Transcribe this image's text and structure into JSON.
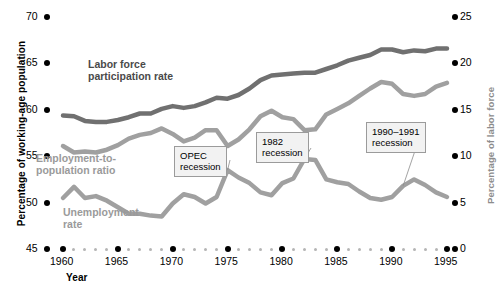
{
  "chart_data": {
    "type": "line",
    "title": "",
    "xlabel": "Year",
    "ylabel": "Percentage of working-age population",
    "ylabel_right": "Percentage of labor force",
    "x": [
      1960,
      1961,
      1962,
      1963,
      1964,
      1965,
      1966,
      1967,
      1968,
      1969,
      1970,
      1971,
      1972,
      1973,
      1974,
      1975,
      1976,
      1977,
      1978,
      1979,
      1980,
      1981,
      1982,
      1983,
      1984,
      1985,
      1986,
      1987,
      1988,
      1989,
      1990,
      1991,
      1992,
      1993,
      1994,
      1995
    ],
    "xlim": [
      1959,
      1995.5
    ],
    "xticks": [
      1960,
      1965,
      1970,
      1975,
      1980,
      1985,
      1990,
      1995
    ],
    "xticklabels": [
      "1960",
      "1965",
      "1970",
      "1975",
      "1980",
      "1985",
      "1990",
      "1995"
    ],
    "ylim": [
      45,
      70
    ],
    "yticks": [
      45,
      50,
      55,
      60,
      65,
      70
    ],
    "yticklabels": [
      "45",
      "50",
      "55",
      "60",
      "65",
      "70"
    ],
    "ylim_right": [
      0,
      25
    ],
    "yticks_right": [
      0,
      5,
      10,
      15,
      20,
      25
    ],
    "yticklabels_right": [
      "0",
      "5",
      "10",
      "15",
      "20",
      "25"
    ],
    "grid": false,
    "legend": "inline-labels",
    "series": [
      {
        "name": "Labor force participation rate",
        "axis": "left",
        "color": "#707070",
        "values": [
          59.4,
          59.3,
          58.8,
          58.7,
          58.7,
          58.9,
          59.2,
          59.6,
          59.6,
          60.1,
          60.4,
          60.2,
          60.4,
          60.8,
          61.3,
          61.2,
          61.6,
          62.3,
          63.2,
          63.7,
          63.8,
          63.9,
          64.0,
          64.0,
          64.4,
          64.8,
          65.3,
          65.6,
          65.9,
          66.5,
          66.5,
          66.2,
          66.4,
          66.3,
          66.6,
          66.6
        ]
      },
      {
        "name": "Employment-to-population ratio",
        "axis": "left",
        "color": "#a0a0a0",
        "values": [
          56.1,
          55.4,
          55.5,
          55.4,
          55.7,
          56.2,
          56.9,
          57.3,
          57.5,
          58.0,
          57.4,
          56.6,
          57.0,
          57.8,
          57.8,
          56.1,
          56.8,
          57.9,
          59.3,
          59.9,
          59.2,
          59.0,
          57.8,
          57.9,
          59.5,
          60.1,
          60.7,
          61.5,
          62.3,
          63.0,
          62.8,
          61.7,
          61.5,
          61.7,
          62.5,
          62.9
        ]
      },
      {
        "name": "Unemployment rate",
        "axis": "right",
        "color": "#a0a0a0",
        "values": [
          5.5,
          6.7,
          5.5,
          5.7,
          5.2,
          4.5,
          3.8,
          3.8,
          3.6,
          3.5,
          4.9,
          5.9,
          5.6,
          4.9,
          5.6,
          8.5,
          7.7,
          7.1,
          6.1,
          5.8,
          7.1,
          7.6,
          9.7,
          9.6,
          7.5,
          7.2,
          7.0,
          6.2,
          5.5,
          5.3,
          5.6,
          6.8,
          7.5,
          6.9,
          6.1,
          5.6
        ]
      }
    ],
    "annotations": [
      {
        "id": "opec",
        "line1": "OPEC",
        "line2": "recession",
        "target_year": 1975
      },
      {
        "id": "r1982",
        "line1": "1982",
        "line2": "recession",
        "target_year": 1982
      },
      {
        "id": "r1990",
        "line1": "1990–1991",
        "line2": "recession",
        "target_year": 1991
      }
    ]
  },
  "axes": {
    "left_title": "Percentage of working-age population",
    "right_title": "Percentage of labor force",
    "x_title": "Year"
  },
  "series_labels": {
    "lfpr_line1": "Labor force",
    "lfpr_line2": "participation rate",
    "epr_line1": "Employment-to-",
    "epr_line2": "population ratio",
    "unemp_line1": "Unemployment",
    "unemp_line2": "rate"
  },
  "callouts": {
    "opec_line1": "OPEC",
    "opec_line2": "recession",
    "r1982_line1": "1982",
    "r1982_line2": "recession",
    "r1990_line1": "1990–1991",
    "r1990_line2": "recession"
  },
  "colors": {
    "lfpr": "#707070",
    "epr": "#a0a0a0",
    "unemployment": "#a0a0a0",
    "tick": "#000000",
    "minor_tick": "#b5b5b5",
    "callout_bg": "#f2f2f2",
    "callout_border": "#9b9b9b"
  }
}
